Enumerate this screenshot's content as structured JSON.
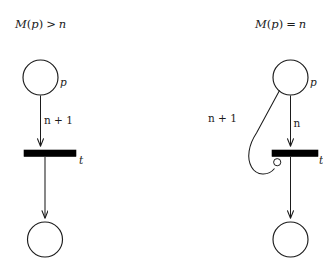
{
  "figure": {
    "background_color": "#ffffff",
    "ink_color": "#1b1b1b",
    "width": 323,
    "height": 265,
    "caption_note": "Petri net arc-weight to inhibitor-arc transformation"
  },
  "panels": [
    {
      "id": "left",
      "condition_label": "M(p) > n",
      "condition_parts": {
        "func": "M",
        "open_paren": "(",
        "arg": "p",
        "close_paren": ")",
        "relation": ">",
        "bound": "n"
      },
      "place_source_label": "p",
      "place_target_label": "",
      "transition_label": "t",
      "arcs": [
        {
          "name": "input-arc",
          "label": "n + 1",
          "kind": "normal",
          "from": "place-source",
          "to": "transition"
        },
        {
          "name": "output-arc",
          "label": "",
          "kind": "normal",
          "from": "transition",
          "to": "place-target"
        }
      ]
    },
    {
      "id": "right",
      "condition_label": "M(p) = n",
      "condition_parts": {
        "func": "M",
        "open_paren": "(",
        "arg": "p",
        "close_paren": ")",
        "relation": "=",
        "bound": "n"
      },
      "place_source_label": "p",
      "place_target_label": "",
      "transition_label": "t",
      "arcs": [
        {
          "name": "inhibitor-arc",
          "label": "n + 1",
          "kind": "inhibitor",
          "from": "place-source",
          "to": "transition"
        },
        {
          "name": "input-arc",
          "label": "n",
          "kind": "normal",
          "from": "place-source",
          "to": "transition"
        },
        {
          "name": "output-arc",
          "label": "",
          "kind": "normal",
          "from": "transition",
          "to": "place-target"
        }
      ]
    }
  ],
  "labels": {
    "left_condition": "M(p) > n",
    "left_place_p": "p",
    "left_arc_weight": "n + 1",
    "left_transition_t": "t",
    "right_condition": "M(p) = n",
    "right_place_p": "p",
    "right_inhibitor_weight": "n + 1",
    "right_arc_weight": "n",
    "right_transition_t": "t"
  }
}
